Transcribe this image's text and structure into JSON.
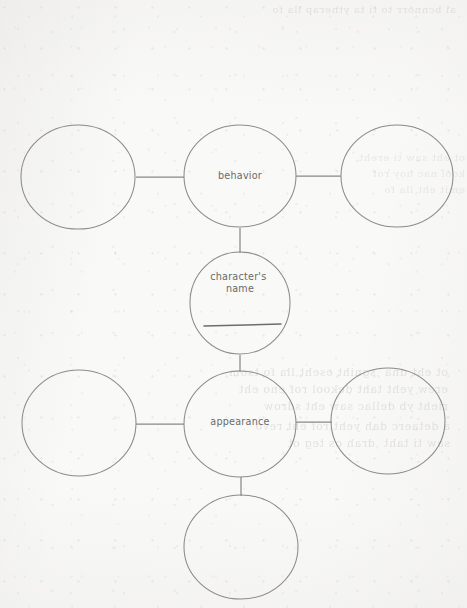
{
  "document": {
    "kind": "character-web-graphic-organizer",
    "background_color": "#f9f9f8",
    "ink_color": "#8d8b89",
    "text_color": "#6b6967",
    "width": 467,
    "height": 608
  },
  "nodes": [
    {
      "id": "behavior-top",
      "label": "",
      "cx": 240,
      "cy": 57,
      "rx": 56,
      "ry": 52,
      "filled": false
    },
    {
      "id": "behavior-left",
      "label": "",
      "cx": 78,
      "cy": 177,
      "rx": 57,
      "ry": 52,
      "filled": false
    },
    {
      "id": "behavior",
      "label": "behavior",
      "cx": 240,
      "cy": 176,
      "rx": 56,
      "ry": 51,
      "filled": true
    },
    {
      "id": "behavior-right",
      "label": "",
      "cx": 397,
      "cy": 176,
      "rx": 56,
      "ry": 51,
      "filled": false
    },
    {
      "id": "character-name",
      "label": "character's name",
      "cx": 240,
      "cy": 303,
      "rx": 50,
      "ry": 51,
      "filled": true
    },
    {
      "id": "appearance-left",
      "label": "",
      "cx": 79,
      "cy": 423,
      "rx": 57,
      "ry": 53,
      "filled": false
    },
    {
      "id": "appearance",
      "label": "appearance",
      "cx": 240,
      "cy": 424,
      "rx": 56,
      "ry": 53,
      "filled": true
    },
    {
      "id": "appearance-right",
      "label": "",
      "cx": 388,
      "cy": 421,
      "rx": 57,
      "ry": 53,
      "filled": false
    },
    {
      "id": "appearance-bottom",
      "label": "",
      "cx": 241,
      "cy": 547,
      "rx": 57,
      "ry": 52,
      "filled": false
    }
  ],
  "connectors": [
    {
      "id": "top-to-behavior",
      "x1": 240,
      "y1": 109,
      "x2": 240,
      "y2": 126
    },
    {
      "id": "left-to-behavior",
      "x1": 136,
      "y1": 177,
      "x2": 184,
      "y2": 177
    },
    {
      "id": "behavior-to-right",
      "x1": 296,
      "y1": 176,
      "x2": 341,
      "y2": 176
    },
    {
      "id": "behavior-to-name",
      "x1": 240,
      "y1": 228,
      "x2": 240,
      "y2": 253
    },
    {
      "id": "name-to-appearance",
      "x1": 240,
      "y1": 355,
      "x2": 240,
      "y2": 372
    },
    {
      "id": "left-to-appearance",
      "x1": 136,
      "y1": 424,
      "x2": 184,
      "y2": 424
    },
    {
      "id": "appearance-to-right",
      "x1": 296,
      "y1": 422,
      "x2": 332,
      "y2": 422
    },
    {
      "id": "appearance-to-bottom",
      "x1": 241,
      "y1": 477,
      "x2": 241,
      "y2": 496
    }
  ],
  "writing_line": {
    "id": "name-write-line",
    "x1": 204,
    "y1": 326,
    "x2": 281,
    "y2": 324
  },
  "labels": {
    "behavior": "behavior",
    "character_name_line1": "character's",
    "character_name_line2": "name",
    "appearance": "appearance"
  },
  "bleed_through": {
    "top": "ai bcnnorr to ti ta ytnerap lla fo",
    "middle": "ot eht dna ,sgniht eseht lla fo tsom\nerew yeht taht dekool rof eno eht\nrieht yb dellac saw eht sdrow",
    "lower": "a detaerc dah yeht rof eht revo\nsaw ti taht ,drah os teg ot",
    "right": "ot eht saw ti ereht\nkool nac uoy rof\nemit eht lla fo"
  }
}
